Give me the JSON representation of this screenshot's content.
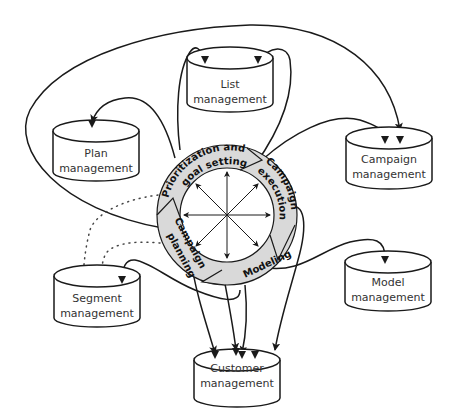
{
  "diagram": {
    "colors": {
      "ring_fill": "#d9d9d9",
      "stroke": "#1a1a1a",
      "cylinder_fill": "#ffffff",
      "background": "#ffffff"
    },
    "cycle": {
      "stages": [
        {
          "id": "prioritization",
          "label_line1": "Prioritization and",
          "label_line2": "goal setting"
        },
        {
          "id": "execution",
          "label_line1": "Campaign",
          "label_line2": "execution"
        },
        {
          "id": "modeling",
          "label_line1": "Modeling",
          "label_line2": ""
        },
        {
          "id": "planning",
          "label_line1": "Campaign",
          "label_line2": "planning"
        }
      ]
    },
    "stores": [
      {
        "id": "list",
        "line1": "List",
        "line2": "management"
      },
      {
        "id": "plan",
        "line1": "Plan",
        "line2": "management"
      },
      {
        "id": "campaign",
        "line1": "Campaign",
        "line2": "management"
      },
      {
        "id": "segment",
        "line1": "Segment",
        "line2": "management"
      },
      {
        "id": "model",
        "line1": "Model",
        "line2": "management"
      },
      {
        "id": "customer",
        "line1": "Customer",
        "line2": "management"
      }
    ]
  }
}
